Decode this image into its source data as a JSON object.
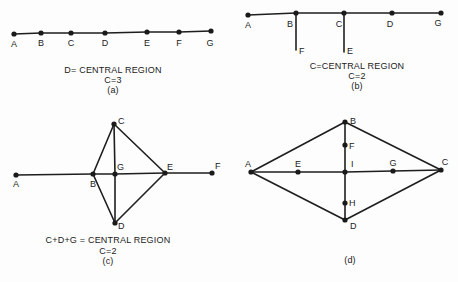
{
  "figures": [
    {
      "id": "a",
      "nodes": [
        {
          "name": "A",
          "x": 14,
          "y": 34,
          "lx": 14,
          "ly": 47,
          "anchor": "middle"
        },
        {
          "name": "B",
          "x": 41,
          "y": 33,
          "lx": 41,
          "ly": 46,
          "anchor": "middle"
        },
        {
          "name": "C",
          "x": 71,
          "y": 33,
          "lx": 71,
          "ly": 46,
          "anchor": "middle"
        },
        {
          "name": "D",
          "x": 105,
          "y": 33,
          "lx": 105,
          "ly": 46,
          "anchor": "middle"
        },
        {
          "name": "E",
          "x": 147,
          "y": 32,
          "lx": 147,
          "ly": 46,
          "anchor": "middle"
        },
        {
          "name": "F",
          "x": 179,
          "y": 32,
          "lx": 179,
          "ly": 46,
          "anchor": "middle"
        },
        {
          "name": "G",
          "x": 211,
          "y": 31,
          "lx": 210,
          "ly": 46,
          "anchor": "middle"
        }
      ],
      "edges": [
        [
          "A",
          "B"
        ],
        [
          "B",
          "C"
        ],
        [
          "C",
          "D"
        ],
        [
          "D",
          "E"
        ],
        [
          "E",
          "F"
        ],
        [
          "F",
          "G"
        ]
      ],
      "caption": [
        "D= CENTRAL REGION",
        "C=3",
        "(a)"
      ],
      "caption_x": 113,
      "caption_y": [
        73,
        83,
        93
      ]
    },
    {
      "id": "b",
      "nodes": [
        {
          "name": "A",
          "x": 248,
          "y": 15,
          "lx": 248,
          "ly": 28,
          "anchor": "middle"
        },
        {
          "name": "B",
          "x": 296,
          "y": 13,
          "lx": 290,
          "ly": 27,
          "anchor": "middle"
        },
        {
          "name": "C",
          "x": 344,
          "y": 13,
          "lx": 339,
          "ly": 27,
          "anchor": "middle"
        },
        {
          "name": "D",
          "x": 392,
          "y": 13,
          "lx": 390,
          "ly": 27,
          "anchor": "middle"
        },
        {
          "name": "G",
          "x": 441,
          "y": 13,
          "lx": 438,
          "ly": 26,
          "anchor": "middle"
        },
        {
          "name": "F",
          "x": 296,
          "y": 50,
          "lx": 299,
          "ly": 54,
          "anchor": "start",
          "dot": false
        },
        {
          "name": "E",
          "x": 344,
          "y": 52,
          "lx": 347,
          "ly": 54,
          "anchor": "start",
          "dot": false
        }
      ],
      "edges": [
        [
          "A",
          "B"
        ],
        [
          "B",
          "C"
        ],
        [
          "C",
          "D"
        ],
        [
          "D",
          "G"
        ],
        [
          "B",
          "F"
        ],
        [
          "C",
          "E"
        ]
      ],
      "caption": [
        "C=CENTRAL REGION",
        "C=2",
        "(b)"
      ],
      "caption_x": 357,
      "caption_y": [
        69,
        79,
        89
      ]
    },
    {
      "id": "c",
      "nodes": [
        {
          "name": "A",
          "x": 16,
          "y": 175,
          "lx": 16,
          "ly": 187,
          "anchor": "middle"
        },
        {
          "name": "B",
          "x": 93,
          "y": 174,
          "lx": 93,
          "ly": 187,
          "anchor": "middle"
        },
        {
          "name": "G",
          "x": 115,
          "y": 174,
          "lx": 117,
          "ly": 170,
          "anchor": "start"
        },
        {
          "name": "E",
          "x": 165,
          "y": 173,
          "lx": 167,
          "ly": 170,
          "anchor": "start"
        },
        {
          "name": "F",
          "x": 212,
          "y": 173,
          "lx": 215,
          "ly": 169,
          "anchor": "start"
        },
        {
          "name": "C",
          "x": 114,
          "y": 124,
          "lx": 118,
          "ly": 124,
          "anchor": "start"
        },
        {
          "name": "D",
          "x": 115,
          "y": 223,
          "lx": 118,
          "ly": 229,
          "anchor": "start"
        }
      ],
      "edges": [
        [
          "A",
          "B"
        ],
        [
          "B",
          "G"
        ],
        [
          "G",
          "E"
        ],
        [
          "E",
          "F"
        ],
        [
          "B",
          "C"
        ],
        [
          "C",
          "E"
        ],
        [
          "B",
          "D"
        ],
        [
          "D",
          "E"
        ],
        [
          "C",
          "G"
        ],
        [
          "G",
          "D"
        ]
      ],
      "caption": [
        "C+D+G = CENTRAL REGION",
        "C=2",
        "(c)"
      ],
      "caption_x": 108,
      "caption_y": [
        243,
        254,
        264
      ]
    },
    {
      "id": "d",
      "nodes": [
        {
          "name": "A",
          "x": 251,
          "y": 172,
          "lx": 248,
          "ly": 167,
          "anchor": "middle"
        },
        {
          "name": "E",
          "x": 298,
          "y": 172,
          "lx": 298,
          "ly": 167,
          "anchor": "middle"
        },
        {
          "name": "I",
          "x": 345,
          "y": 172,
          "lx": 351,
          "ly": 167,
          "anchor": "start"
        },
        {
          "name": "G",
          "x": 393,
          "y": 171,
          "lx": 393,
          "ly": 166,
          "anchor": "middle"
        },
        {
          "name": "C",
          "x": 441,
          "y": 170,
          "lx": 445,
          "ly": 165,
          "anchor": "middle"
        },
        {
          "name": "B",
          "x": 345,
          "y": 122,
          "lx": 350,
          "ly": 124,
          "anchor": "start"
        },
        {
          "name": "F",
          "x": 345,
          "y": 145,
          "lx": 349,
          "ly": 149,
          "anchor": "start"
        },
        {
          "name": "H",
          "x": 345,
          "y": 203,
          "lx": 349,
          "ly": 206,
          "anchor": "start"
        },
        {
          "name": "D",
          "x": 345,
          "y": 220,
          "lx": 350,
          "ly": 229,
          "anchor": "start"
        }
      ],
      "edges": [
        [
          "A",
          "E"
        ],
        [
          "E",
          "I"
        ],
        [
          "I",
          "G"
        ],
        [
          "G",
          "C"
        ],
        [
          "A",
          "B"
        ],
        [
          "B",
          "C"
        ],
        [
          "A",
          "D"
        ],
        [
          "D",
          "C"
        ],
        [
          "B",
          "F"
        ],
        [
          "F",
          "I"
        ],
        [
          "I",
          "H"
        ],
        [
          "H",
          "D"
        ]
      ],
      "caption": [
        "(d)"
      ],
      "caption_x": 350,
      "caption_y": [
        263
      ]
    }
  ]
}
